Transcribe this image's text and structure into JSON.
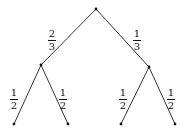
{
  "diagram": {
    "type": "probability-tree",
    "nodes": {
      "root": {
        "x": 96,
        "y": 9
      },
      "left": {
        "x": 41,
        "y": 65
      },
      "right": {
        "x": 149,
        "y": 67
      },
      "leaf_ll": {
        "x": 14,
        "y": 124
      },
      "leaf_lr": {
        "x": 68,
        "y": 124
      },
      "leaf_rl": {
        "x": 121,
        "y": 124
      },
      "leaf_rr": {
        "x": 175,
        "y": 124
      }
    },
    "edges": [
      {
        "from": "root",
        "to": "left",
        "num": "2",
        "den": "3"
      },
      {
        "from": "root",
        "to": "right",
        "num": "1",
        "den": "3"
      },
      {
        "from": "left",
        "to": "leaf_ll",
        "num": "1",
        "den": "2"
      },
      {
        "from": "left",
        "to": "leaf_lr",
        "num": "1",
        "den": "2"
      },
      {
        "from": "right",
        "to": "leaf_rl",
        "num": "1",
        "den": "2"
      },
      {
        "from": "right",
        "to": "leaf_rr",
        "num": "1",
        "den": "2"
      }
    ],
    "line_color": "#333333"
  }
}
